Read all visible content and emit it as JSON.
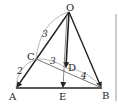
{
  "diagram": {
    "points": {
      "O": {
        "label": "O",
        "x": 69,
        "y": 12
      },
      "A": {
        "label": "A",
        "x": 16,
        "y": 88
      },
      "B": {
        "label": "B",
        "x": 102,
        "y": 88
      },
      "C": {
        "label": "C",
        "x": 36,
        "y": 59
      },
      "D": {
        "label": "D",
        "x": 66,
        "y": 68
      },
      "E": {
        "label": "E",
        "x": 63,
        "y": 88
      }
    },
    "lengths": {
      "OC": "3",
      "CA": "2",
      "CD": "3",
      "DB": "4"
    },
    "colors": {
      "stroke": "#222222",
      "thin": "#555555",
      "border": "#bbbbbb"
    }
  }
}
